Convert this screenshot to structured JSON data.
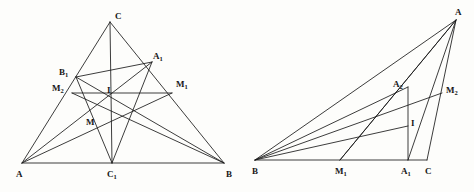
{
  "figure": {
    "stroke_color": "#1a1a1a",
    "background_color": "#fdfdfb",
    "width": 474,
    "height": 192
  },
  "left_figure": {
    "name": "acute-triangle-construction",
    "points": {
      "A": {
        "label": "A",
        "sub": "",
        "x": 22,
        "y": 163,
        "lx": 16,
        "ly": 170
      },
      "B": {
        "label": "B",
        "sub": "",
        "x": 224,
        "y": 163,
        "lx": 226,
        "ly": 170
      },
      "C": {
        "label": "C",
        "sub": "",
        "x": 110,
        "y": 22,
        "lx": 115,
        "ly": 12
      },
      "A1": {
        "label": "A",
        "sub": "1",
        "x": 152,
        "y": 62,
        "lx": 153,
        "ly": 52
      },
      "B1": {
        "label": "B",
        "sub": "1",
        "x": 76,
        "y": 77,
        "lx": 59,
        "ly": 68
      },
      "C1": {
        "label": "C",
        "sub": "1",
        "x": 112,
        "y": 163,
        "lx": 107,
        "ly": 170
      },
      "M1": {
        "label": "M",
        "sub": "1",
        "x": 172,
        "y": 93,
        "lx": 176,
        "ly": 80
      },
      "M2": {
        "label": "M",
        "sub": "2",
        "x": 72,
        "y": 93,
        "lx": 52,
        "ly": 84
      },
      "I": {
        "label": "I",
        "sub": "",
        "x": 112,
        "y": 108,
        "lx": 107,
        "ly": 86
      },
      "M": {
        "label": "M",
        "sub": "",
        "x": 94,
        "y": 124,
        "lx": 86,
        "ly": 118
      }
    },
    "segments": [
      {
        "name": "side-AB",
        "from": "A",
        "to": "B"
      },
      {
        "name": "side-AC",
        "from": "A",
        "to": "C"
      },
      {
        "name": "side-CB",
        "from": "C",
        "to": "B"
      },
      {
        "name": "cevian-C-to-C1",
        "from": "C",
        "to": "C1"
      },
      {
        "name": "cevian-A-to-A1",
        "from": "A",
        "to": "A1"
      },
      {
        "name": "cevian-A-to-M1",
        "from": "A",
        "to": "M1"
      },
      {
        "name": "cevian-B-to-B1",
        "from": "B",
        "to": "B1"
      },
      {
        "name": "cevian-B-to-M2",
        "from": "B",
        "to": "M2"
      },
      {
        "name": "segment-B1-A1",
        "from": "B1",
        "to": "A1"
      },
      {
        "name": "segment-A1-C1",
        "from": "A1",
        "to": "C1"
      },
      {
        "name": "segment-B1-C1",
        "from": "B1",
        "to": "C1"
      },
      {
        "name": "segment-M2-M1",
        "from": "M2",
        "to": "M1"
      }
    ],
    "labels_order": [
      "C",
      "A1",
      "B1",
      "M2",
      "M1",
      "I",
      "M",
      "A",
      "C1",
      "B"
    ]
  },
  "right_figure": {
    "name": "obtuse-triangle-construction",
    "points": {
      "A": {
        "label": "A",
        "sub": "",
        "x": 456,
        "y": 20,
        "lx": 455,
        "ly": 8
      },
      "B": {
        "label": "B",
        "sub": "",
        "x": 255,
        "y": 160,
        "lx": 252,
        "ly": 167
      },
      "C": {
        "label": "C",
        "sub": "",
        "x": 427,
        "y": 160,
        "lx": 425,
        "ly": 167
      },
      "A1": {
        "label": "A",
        "sub": "1",
        "x": 408,
        "y": 160,
        "lx": 401,
        "ly": 167
      },
      "A2": {
        "label": "A",
        "sub": "2",
        "x": 408,
        "y": 87,
        "lx": 393,
        "ly": 80
      },
      "M1": {
        "label": "M",
        "sub": "1",
        "x": 340,
        "y": 160,
        "lx": 335,
        "ly": 167
      },
      "M2": {
        "label": "M",
        "sub": "2",
        "x": 442,
        "y": 93,
        "lx": 446,
        "ly": 86
      },
      "I": {
        "label": "I",
        "sub": "",
        "x": 408,
        "y": 126,
        "lx": 411,
        "ly": 119
      }
    },
    "segments": [
      {
        "name": "side-BC",
        "from": "B",
        "to": "C"
      },
      {
        "name": "side-BA",
        "from": "B",
        "to": "A"
      },
      {
        "name": "side-AC",
        "from": "A",
        "to": "C"
      },
      {
        "name": "altitude-A-to-A1",
        "from": "A",
        "to": "A1"
      },
      {
        "name": "cevian-A-to-M1",
        "from": "A",
        "to": "M1"
      },
      {
        "name": "vertical-A1-A2",
        "from": "A1",
        "to": "A2"
      },
      {
        "name": "cevian-B-to-A2",
        "from": "B",
        "to": "A2"
      },
      {
        "name": "cevian-B-to-M2",
        "from": "B",
        "to": "M2"
      },
      {
        "name": "cevian-B-to-I",
        "from": "B",
        "to": "I"
      },
      {
        "name": "segment-M1-A",
        "from": "M1",
        "to": "A"
      }
    ],
    "labels_order": [
      "A",
      "A2",
      "M2",
      "I",
      "B",
      "M1",
      "A1",
      "C"
    ]
  }
}
